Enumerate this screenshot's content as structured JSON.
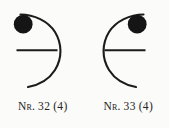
{
  "plate": {
    "background_color": "#fbfbfa",
    "ink_color": "#1b1b1b",
    "figure_count": 2
  },
  "figures": [
    {
      "id": "figure-32",
      "caption": {
        "prefix": "Nr.",
        "number": "32",
        "qualifier": "(4)",
        "full": "Nr. 32 (4)"
      },
      "elements": {
        "arc": {
          "name": "crescent-arc",
          "opening": "left",
          "center_x": 26,
          "center_y": 52,
          "radius": 38,
          "stroke_width": 2.1
        },
        "bar": {
          "name": "horizontal-bar",
          "x1": 17,
          "x2": 56,
          "y": 50,
          "stroke_width": 2.1
        },
        "disc": {
          "name": "filled-disc",
          "cx": 23,
          "cy": 24,
          "r": 9.5,
          "fill": "#151515"
        }
      }
    },
    {
      "id": "figure-33",
      "caption": {
        "prefix": "Nr.",
        "number": "33",
        "qualifier": "(4)",
        "full": "Nr. 33 (4)"
      },
      "elements": {
        "arc": {
          "name": "crescent-arc",
          "opening": "right",
          "center_x": 143,
          "center_y": 52,
          "radius": 38,
          "stroke_width": 2.1
        },
        "bar": {
          "name": "horizontal-bar",
          "x1": 105,
          "x2": 144,
          "y": 50,
          "stroke_width": 2.1
        },
        "disc": {
          "name": "filled-disc",
          "cx": 137,
          "cy": 24,
          "r": 9.5,
          "fill": "#151515"
        }
      }
    }
  ]
}
